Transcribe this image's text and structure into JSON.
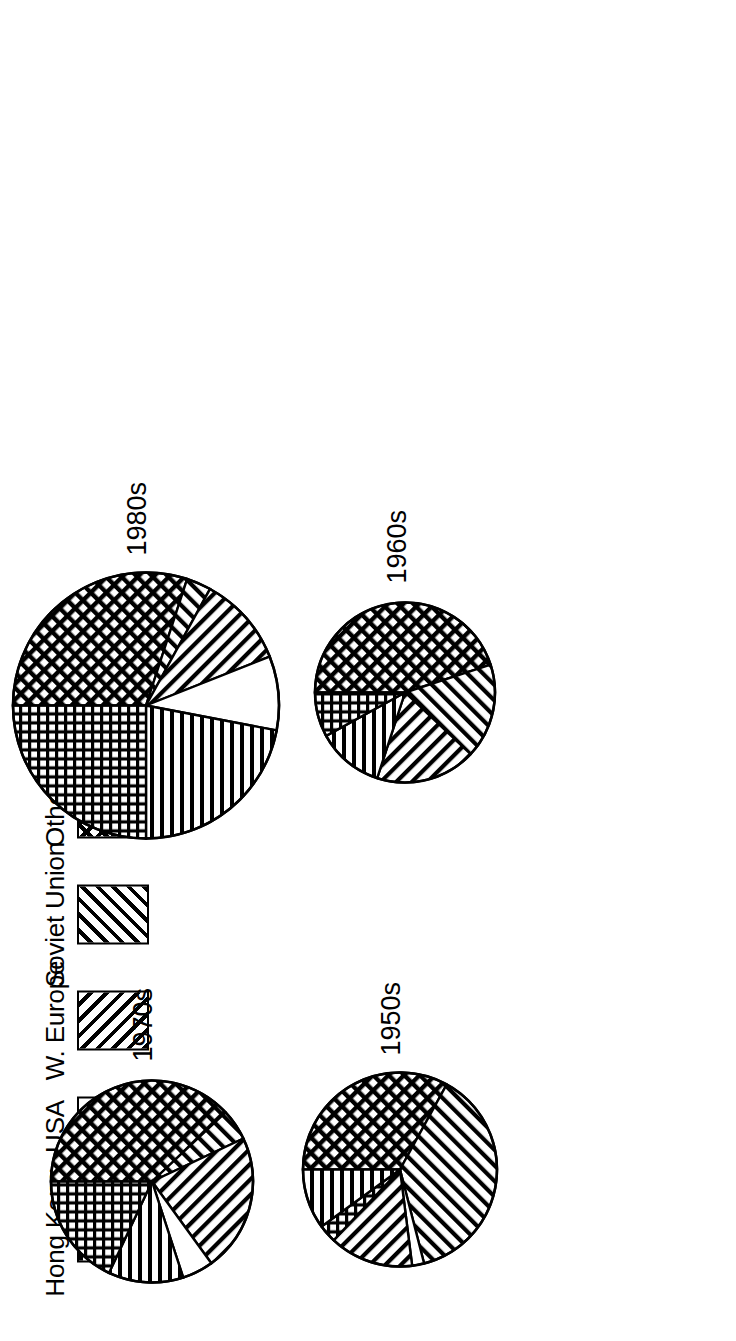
{
  "legend": {
    "items": [
      {
        "label": "Hong Kong",
        "key": "hk",
        "pattern": "horizontal-lines"
      },
      {
        "label": "USA",
        "key": "usa",
        "pattern": "blank"
      },
      {
        "label": "W. Europe",
        "key": "we",
        "pattern": "diagonal-lines-forward"
      },
      {
        "label": "Soviet Union",
        "key": "su",
        "pattern": "diagonal-lines-back"
      },
      {
        "label": "Others",
        "key": "oth",
        "pattern": "diagonal-crosshatch"
      },
      {
        "label": "Japan",
        "key": "jp",
        "pattern": "square-grid"
      }
    ]
  },
  "pies": {
    "p1950": {
      "label": "1950s"
    },
    "p1960": {
      "label": "1960s"
    },
    "p1970": {
      "label": "1970s"
    },
    "p1980": {
      "label": "1980s"
    }
  },
  "chart_data": {
    "type": "pie",
    "title": "",
    "legend_position": "top",
    "categories": [
      "Hong Kong",
      "USA",
      "W. Europe",
      "Soviet Union",
      "Others",
      "Japan"
    ],
    "charts": [
      {
        "title": "1950s",
        "radius_px": 88,
        "slices": [
          {
            "name": "Others",
            "value": 33
          },
          {
            "name": "Soviet Union",
            "value": 38
          },
          {
            "name": "USA",
            "value": 2
          },
          {
            "name": "W. Europe",
            "value": 14
          },
          {
            "name": "Japan",
            "value": 3
          },
          {
            "name": "Hong Kong",
            "value": 10
          }
        ]
      },
      {
        "title": "1960s",
        "radius_px": 80,
        "slices": [
          {
            "name": "Others",
            "value": 45
          },
          {
            "name": "Soviet Union",
            "value": 17
          },
          {
            "name": "W. Europe",
            "value": 18
          },
          {
            "name": "Hong Kong",
            "value": 12
          },
          {
            "name": "Japan",
            "value": 8
          }
        ]
      },
      {
        "title": "1970s",
        "radius_px": 92,
        "slices": [
          {
            "name": "Others",
            "value": 38
          },
          {
            "name": "Soviet Union",
            "value": 5
          },
          {
            "name": "W. Europe",
            "value": 22
          },
          {
            "name": "USA",
            "value": 5
          },
          {
            "name": "Hong Kong",
            "value": 12
          },
          {
            "name": "Japan",
            "value": 18
          }
        ]
      },
      {
        "title": "1980s",
        "radius_px": 122,
        "slices": [
          {
            "name": "Others",
            "value": 30
          },
          {
            "name": "Soviet Union",
            "value": 3
          },
          {
            "name": "W. Europe",
            "value": 11
          },
          {
            "name": "USA",
            "value": 9
          },
          {
            "name": "Hong Kong",
            "value": 22
          },
          {
            "name": "Japan",
            "value": 25
          }
        ]
      }
    ]
  }
}
